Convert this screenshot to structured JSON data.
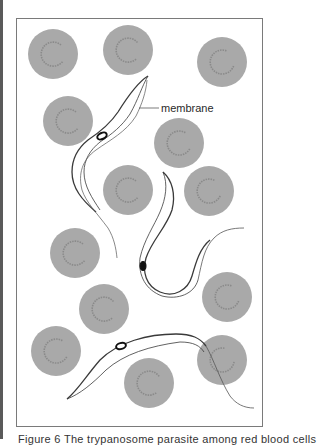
{
  "figure": {
    "label_membrane": "membrane",
    "caption": "Figure 6 The trypanosome parasite among red blood cells",
    "colors": {
      "cell_fill": "#a9a9a9",
      "cell_crescent": "#8a8a8a",
      "outline": "#3a3a3a",
      "nucleus": "#111111",
      "frame": "#7a7a7a"
    },
    "cells": [
      {
        "id": "rbc-1"
      },
      {
        "id": "rbc-2"
      },
      {
        "id": "rbc-3"
      },
      {
        "id": "rbc-4"
      },
      {
        "id": "rbc-5"
      },
      {
        "id": "rbc-6"
      },
      {
        "id": "rbc-7"
      },
      {
        "id": "rbc-8"
      },
      {
        "id": "rbc-9"
      },
      {
        "id": "rbc-10"
      },
      {
        "id": "rbc-11"
      },
      {
        "id": "rbc-12"
      },
      {
        "id": "rbc-13"
      }
    ],
    "parasites": [
      {
        "id": "trypanosome-1"
      },
      {
        "id": "trypanosome-2"
      },
      {
        "id": "trypanosome-3"
      }
    ]
  }
}
